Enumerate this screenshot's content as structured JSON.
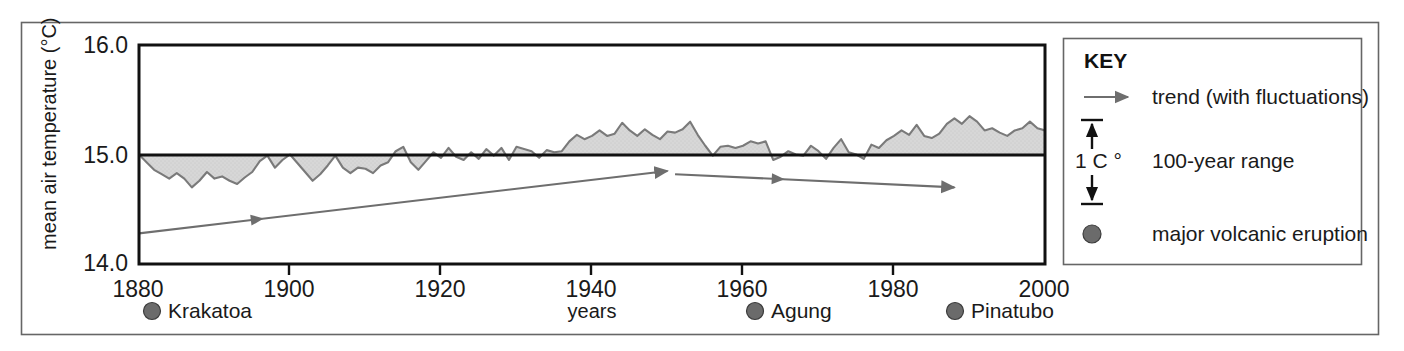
{
  "figure": {
    "background_color": "#ffffff",
    "frame_color": "#555555"
  },
  "chart_data": {
    "type": "area",
    "title": "",
    "subtitle": "",
    "xlabel": "years",
    "ylabel": "mean air temperature (°C)",
    "xlim": [
      1880,
      2000
    ],
    "ylim": [
      14.0,
      16.0
    ],
    "grid": false,
    "baseline_value": 15.0,
    "baseline_label": "15.0",
    "x_ticks": [
      "1880",
      "1900",
      "1920",
      "1940",
      "1960",
      "1980",
      "2000"
    ],
    "x_tick_values": [
      1880,
      1900,
      1920,
      1940,
      1960,
      1980,
      2000
    ],
    "y_ticks": [
      "14.0",
      "15.0",
      "16.0"
    ],
    "y_tick_values": [
      14.0,
      15.0,
      16.0
    ],
    "series": [
      {
        "name": "mean air temperature",
        "fill_color": "#d5d5d5",
        "line_color": "#7a7a7a",
        "x": [
          1880,
          1881,
          1882,
          1883,
          1884,
          1885,
          1886,
          1887,
          1888,
          1889,
          1890,
          1891,
          1892,
          1893,
          1894,
          1895,
          1896,
          1897,
          1898,
          1899,
          1900,
          1901,
          1902,
          1903,
          1904,
          1905,
          1906,
          1907,
          1908,
          1909,
          1910,
          1911,
          1912,
          1913,
          1914,
          1915,
          1916,
          1917,
          1918,
          1919,
          1920,
          1921,
          1922,
          1923,
          1924,
          1925,
          1926,
          1927,
          1928,
          1929,
          1930,
          1931,
          1932,
          1933,
          1934,
          1935,
          1936,
          1937,
          1938,
          1939,
          1940,
          1941,
          1942,
          1943,
          1944,
          1945,
          1946,
          1947,
          1948,
          1949,
          1950,
          1951,
          1952,
          1953,
          1954,
          1955,
          1956,
          1957,
          1958,
          1959,
          1960,
          1961,
          1962,
          1963,
          1964,
          1965,
          1966,
          1967,
          1968,
          1969,
          1970,
          1971,
          1972,
          1973,
          1974,
          1975,
          1976,
          1977,
          1978,
          1979,
          1980,
          1981,
          1982,
          1983,
          1984,
          1985,
          1986,
          1987,
          1988,
          1989,
          1990,
          1991,
          1992,
          1993,
          1994,
          1995,
          1996,
          1997,
          1998,
          1999,
          2000
        ],
        "y": [
          15.0,
          14.93,
          14.86,
          14.82,
          14.78,
          14.83,
          14.78,
          14.7,
          14.76,
          14.84,
          14.78,
          14.8,
          14.76,
          14.73,
          14.79,
          14.84,
          14.94,
          14.99,
          14.88,
          14.95,
          15.0,
          14.92,
          14.84,
          14.76,
          14.82,
          14.9,
          14.99,
          14.88,
          14.83,
          14.88,
          14.87,
          14.83,
          14.9,
          14.93,
          15.03,
          15.07,
          14.93,
          14.86,
          14.94,
          15.02,
          14.97,
          15.06,
          14.98,
          14.95,
          15.02,
          14.96,
          15.05,
          14.99,
          15.06,
          14.95,
          15.07,
          15.05,
          15.03,
          14.97,
          15.04,
          15.02,
          15.03,
          15.12,
          15.18,
          15.14,
          15.17,
          15.22,
          15.17,
          15.19,
          15.29,
          15.22,
          15.17,
          15.23,
          15.18,
          15.14,
          15.21,
          15.2,
          15.23,
          15.3,
          15.18,
          15.08,
          14.99,
          15.07,
          15.08,
          15.06,
          15.08,
          15.12,
          15.1,
          15.12,
          14.95,
          14.98,
          15.03,
          15.0,
          14.99,
          15.08,
          15.03,
          14.96,
          15.06,
          15.14,
          15.02,
          15.0,
          14.96,
          15.09,
          15.06,
          15.13,
          15.17,
          15.22,
          15.18,
          15.27,
          15.17,
          15.15,
          15.19,
          15.28,
          15.33,
          15.28,
          15.35,
          15.3,
          15.22,
          15.24,
          15.2,
          15.17,
          15.22,
          15.24,
          15.3,
          15.24,
          15.22
        ]
      }
    ],
    "trend_lines": [
      {
        "name": "warming trend 1880-1950",
        "label": "trend (with fluctuations)",
        "x_start": 1880,
        "y_start": 14.28,
        "x_end": 1950,
        "y_end": 14.85,
        "mid_arrow_x": 1896,
        "color": "#6e6e6e"
      },
      {
        "name": "cooling trend 1950-1985",
        "label": "trend (with fluctuations)",
        "x_start": 1951,
        "y_start": 14.82,
        "x_end": 1988,
        "y_end": 14.7,
        "mid_arrow_x": 1965,
        "color": "#6e6e6e"
      }
    ],
    "annotations": [
      {
        "name": "krakatoa",
        "label": "Krakatoa",
        "marker_x": 152,
        "text_x": 168,
        "marker": "filled-circle"
      },
      {
        "name": "agung",
        "label": "Agung",
        "marker_x": 755,
        "text_x": 771,
        "marker": "filled-circle"
      },
      {
        "name": "pinatubo",
        "label": "Pinatubo",
        "marker_x": 955,
        "text_x": 971,
        "marker": "filled-circle"
      }
    ]
  },
  "axes": {
    "y_label": "mean air temperature (°C)",
    "x_label": "years",
    "y_ticks": [
      {
        "value": "16.0",
        "y": 45
      },
      {
        "value": "15.0",
        "y": 155
      },
      {
        "value": "14.0",
        "y": 263
      }
    ],
    "x_ticks": [
      {
        "value": "1880",
        "x": 138
      },
      {
        "value": "1900",
        "x": 289
      },
      {
        "value": "1920",
        "x": 440
      },
      {
        "value": "1940",
        "x": 591
      },
      {
        "value": "1960",
        "x": 742
      },
      {
        "value": "1980",
        "x": 893
      },
      {
        "value": "2000",
        "x": 1044
      }
    ]
  },
  "key": {
    "title": "KEY",
    "items": [
      {
        "name": "trend",
        "label": "trend (with fluctuations)",
        "icon": "right-arrow-icon"
      },
      {
        "name": "range",
        "label": "100-year range",
        "unit": "1 C °",
        "icon": "double-headed-vertical-arrow-icon"
      },
      {
        "name": "eruption",
        "label": "major volcanic eruption",
        "icon": "filled-circle-icon"
      }
    ]
  },
  "colors": {
    "fill": "#d5d5d5",
    "stroke": "#7a7a7a",
    "axis": "#111111",
    "marker": "#6b6b6b",
    "frame": "#555555"
  }
}
